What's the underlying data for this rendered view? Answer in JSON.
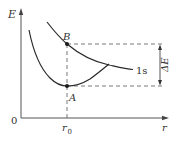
{
  "diagram": {
    "axes": {
      "y_label": "E",
      "x_label": "r",
      "origin_label": "0",
      "x_tick_label": "r",
      "x_tick_subscript": "0"
    },
    "points": [
      {
        "id": "B",
        "label": "B",
        "description": "point on upper 1s curve at r0"
      },
      {
        "id": "A",
        "label": "A",
        "description": "minimum of lower curve at r0"
      }
    ],
    "curves": [
      {
        "id": "upper",
        "label": "1s"
      },
      {
        "id": "lower",
        "label": ""
      }
    ],
    "annotations": {
      "energy_gap_label": "ΔE",
      "energy_gap_letter": "E",
      "energy_gap_delta": "Δ"
    },
    "colors": {
      "ink": "#2a2a2a",
      "dashed": "#6a6a6a",
      "background": "#ffffff"
    }
  }
}
